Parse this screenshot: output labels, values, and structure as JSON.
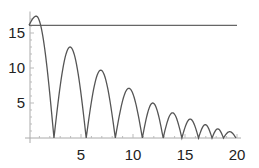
{
  "chart_data": {
    "type": "line",
    "title": "",
    "xlabel": "",
    "ylabel": "",
    "xlim": [
      0,
      20
    ],
    "ylim": [
      0,
      17.5
    ],
    "grid": false,
    "legend": null,
    "x_ticks": [
      5,
      10,
      15,
      20
    ],
    "y_ticks": [
      5,
      10,
      15
    ],
    "x_tick_labels": [
      "5",
      "10",
      "15",
      "20"
    ],
    "y_tick_labels": [
      "5",
      "10",
      "15"
    ],
    "series": [
      {
        "name": "bouncing curve",
        "description": "Successive arch-shaped bounces with decaying height, each touching zero",
        "start": {
          "x": 0,
          "y": 16.1
        },
        "zeros_x": [
          2.4,
          5.5,
          8.3,
          10.9,
          12.9,
          14.7,
          16.3,
          17.6,
          18.7,
          19.9
        ],
        "peaks": [
          {
            "x": 0.7,
            "y": 17.4
          },
          {
            "x": 4.1,
            "y": 13.0
          },
          {
            "x": 6.8,
            "y": 9.7
          },
          {
            "x": 9.6,
            "y": 7.1
          },
          {
            "x": 11.9,
            "y": 5.0
          },
          {
            "x": 13.8,
            "y": 3.6
          },
          {
            "x": 15.5,
            "y": 2.7
          },
          {
            "x": 17.0,
            "y": 1.9
          },
          {
            "x": 18.2,
            "y": 1.3
          },
          {
            "x": 19.3,
            "y": 0.9
          }
        ],
        "color": "#555555"
      },
      {
        "name": "horizontal reference",
        "type": "hline",
        "y": 16.1,
        "x_range": [
          0,
          20
        ],
        "color": "#666666"
      }
    ]
  },
  "layout": {
    "origin_px": {
      "x": 29,
      "y": 138
    },
    "px_per_x": 10.4,
    "px_per_y": 7.0
  }
}
